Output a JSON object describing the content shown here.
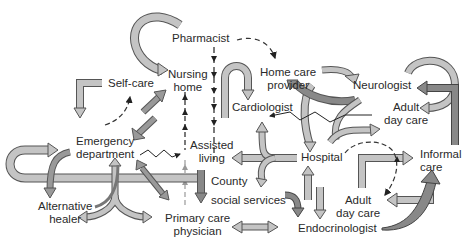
{
  "diagram": {
    "type": "care-network",
    "colors": {
      "arrow_light": "#c4c4c4",
      "arrow_dark": "#8a8a8a",
      "outline": "#555555",
      "text": "#2a2a2a",
      "background": "#ffffff"
    },
    "nodes": {
      "pharmacist": {
        "line1": "Pharmacist"
      },
      "nursing_home": {
        "line1": "Nursing",
        "line2": "home"
      },
      "self_care": {
        "line1": "Self-care"
      },
      "home_care_provider": {
        "line1": "Home care",
        "line2": "provider"
      },
      "neurologist": {
        "line1": "Neurologist"
      },
      "cardiologist": {
        "line1": "Cardiologist"
      },
      "adult_day_care_top": {
        "line1": "Adult",
        "line2": "day care"
      },
      "emergency_department": {
        "line1": "Emergency",
        "line2": "department"
      },
      "assisted_living": {
        "line1": "Assisted",
        "line2": "living"
      },
      "hospital": {
        "line1": "Hospital"
      },
      "informal_care": {
        "line1": "Informal",
        "line2": "care"
      },
      "county_social_services": {
        "line1": "County",
        "line2": "social services"
      },
      "alternative_healer": {
        "line1": "Alternative",
        "line2": "healer"
      },
      "primary_care_physician": {
        "line1": "Primary care",
        "line2": "physician"
      },
      "adult_day_care_bottom": {
        "line1": "Adult",
        "line2": "day care"
      },
      "endocrinologist": {
        "line1": "Endocrinologist"
      }
    }
  }
}
